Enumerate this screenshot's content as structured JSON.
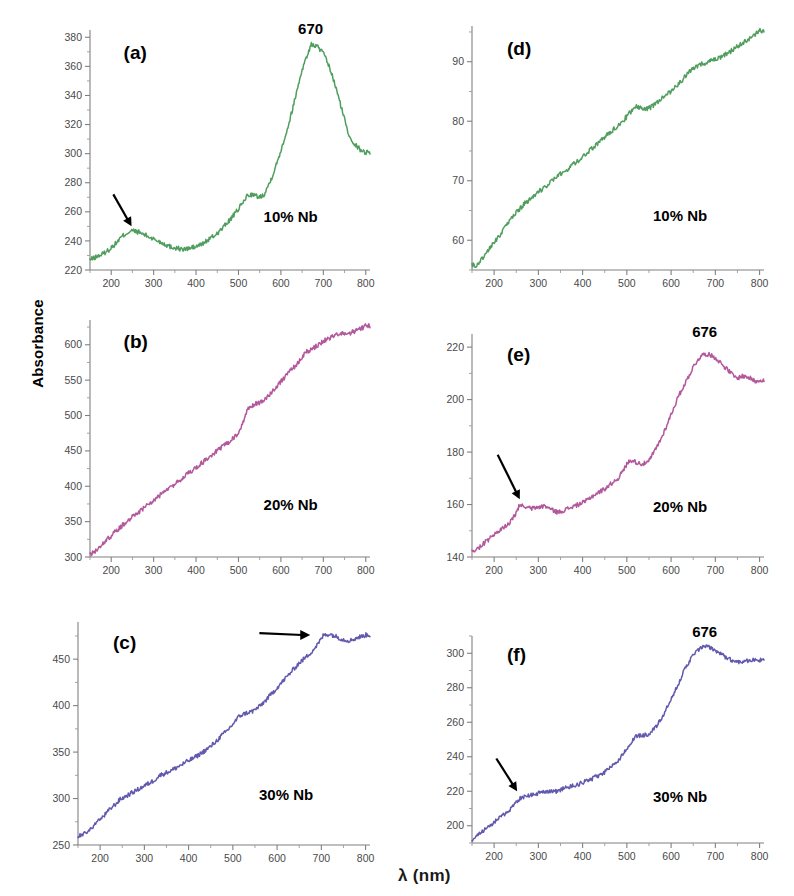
{
  "figure": {
    "y_axis_label": "Absorbance",
    "x_axis_label": "λ (nm)"
  },
  "chart_data": [
    {
      "id": "a",
      "type": "line",
      "panel_letter": "(a)",
      "series_label": "10% Nb",
      "color": "#4f9e5e",
      "title": "",
      "xlabel": "λ (nm)",
      "ylabel": "Absorbance",
      "xlim": [
        150,
        810
      ],
      "ylim": [
        220,
        385
      ],
      "xticks": [
        200,
        300,
        400,
        500,
        600,
        700,
        800
      ],
      "yticks": [
        220,
        240,
        260,
        280,
        300,
        320,
        340,
        360,
        380
      ],
      "grid": false,
      "annotations": [
        {
          "kind": "peak-label",
          "text": "670",
          "x": 670,
          "y": 381
        },
        {
          "kind": "arrow",
          "text": "",
          "from_x": 205,
          "from_y": 272,
          "to_x": 248,
          "to_y": 250
        }
      ],
      "x": [
        150,
        165,
        180,
        195,
        210,
        225,
        240,
        250,
        265,
        280,
        295,
        310,
        325,
        340,
        355,
        370,
        385,
        400,
        415,
        430,
        445,
        460,
        475,
        490,
        500,
        510,
        520,
        530,
        540,
        550,
        560,
        575,
        590,
        605,
        620,
        635,
        650,
        665,
        672,
        685,
        700,
        715,
        730,
        745,
        760,
        775,
        790,
        800
      ],
      "y": [
        227,
        229,
        231,
        234,
        238,
        243,
        246,
        247,
        246,
        244,
        242,
        240,
        238,
        236,
        235,
        234,
        235,
        236,
        238,
        241,
        244,
        248,
        253,
        258,
        262,
        266,
        271,
        272,
        271,
        270,
        272,
        281,
        293,
        307,
        322,
        340,
        358,
        370,
        375,
        374,
        369,
        359,
        345,
        329,
        313,
        306,
        302,
        301
      ]
    },
    {
      "id": "b",
      "type": "line",
      "panel_letter": "(b)",
      "series_label": "20% Nb",
      "color": "#b2589c",
      "title": "",
      "xlabel": "λ (nm)",
      "ylabel": "Absorbance",
      "xlim": [
        150,
        810
      ],
      "ylim": [
        300,
        635
      ],
      "xticks": [
        200,
        300,
        400,
        500,
        600,
        700,
        800
      ],
      "yticks": [
        300,
        350,
        400,
        450,
        500,
        550,
        600
      ],
      "grid": false,
      "annotations": [],
      "x": [
        150,
        165,
        180,
        195,
        210,
        225,
        240,
        255,
        270,
        285,
        300,
        315,
        330,
        345,
        360,
        375,
        390,
        405,
        420,
        435,
        450,
        465,
        480,
        495,
        505,
        515,
        525,
        540,
        555,
        570,
        585,
        600,
        615,
        630,
        645,
        660,
        675,
        690,
        705,
        720,
        735,
        750,
        765,
        780,
        795,
        800
      ],
      "y": [
        302,
        310,
        319,
        327,
        336,
        344,
        352,
        359,
        366,
        373,
        380,
        387,
        394,
        401,
        408,
        415,
        422,
        429,
        436,
        443,
        450,
        457,
        464,
        472,
        479,
        500,
        512,
        516,
        520,
        528,
        538,
        548,
        558,
        568,
        578,
        590,
        595,
        600,
        607,
        611,
        614,
        616,
        617,
        620,
        625,
        627
      ]
    },
    {
      "id": "c",
      "type": "line",
      "panel_letter": "(c)",
      "series_label": "30% Nb",
      "color": "#6159ad",
      "title": "",
      "xlabel": "λ (nm)",
      "ylabel": "Absorbance",
      "xlim": [
        150,
        810
      ],
      "ylim": [
        250,
        490
      ],
      "xticks": [
        200,
        300,
        400,
        500,
        600,
        700,
        800
      ],
      "yticks": [
        250,
        300,
        350,
        400,
        450
      ],
      "grid": false,
      "annotations": [
        {
          "kind": "arrow-horizontal",
          "text": "",
          "from_x": 560,
          "from_y": 478,
          "to_x": 675,
          "to_y": 476
        }
      ],
      "x": [
        150,
        165,
        180,
        195,
        210,
        225,
        235,
        245,
        260,
        275,
        290,
        305,
        320,
        335,
        345,
        360,
        375,
        390,
        405,
        420,
        435,
        450,
        465,
        475,
        485,
        500,
        515,
        530,
        545,
        560,
        575,
        590,
        605,
        620,
        635,
        650,
        665,
        680,
        695,
        705,
        720,
        735,
        750,
        765,
        780,
        795,
        800
      ],
      "y": [
        259,
        262,
        268,
        275,
        282,
        290,
        294,
        299,
        303,
        307,
        311,
        315,
        319,
        325,
        327,
        330,
        334,
        338,
        342,
        346,
        351,
        356,
        363,
        368,
        372,
        380,
        389,
        392,
        394,
        399,
        406,
        414,
        422,
        430,
        438,
        446,
        452,
        459,
        468,
        476,
        477,
        474,
        471,
        470,
        473,
        475,
        476
      ]
    },
    {
      "id": "d",
      "type": "line",
      "panel_letter": "(d)",
      "series_label": "10% Nb",
      "color": "#4f9e5e",
      "title": "",
      "xlabel": "λ (nm)",
      "ylabel": "Absorbance",
      "xlim": [
        150,
        810
      ],
      "ylim": [
        55,
        96
      ],
      "xticks": [
        200,
        300,
        400,
        500,
        600,
        700,
        800
      ],
      "yticks": [
        60,
        70,
        80,
        90
      ],
      "grid": false,
      "annotations": [],
      "x": [
        150,
        160,
        175,
        190,
        205,
        220,
        235,
        250,
        265,
        280,
        295,
        310,
        325,
        340,
        355,
        370,
        385,
        400,
        415,
        430,
        445,
        460,
        475,
        490,
        500,
        510,
        520,
        530,
        545,
        560,
        575,
        590,
        605,
        620,
        635,
        650,
        665,
        680,
        695,
        710,
        725,
        740,
        755,
        770,
        785,
        800
      ],
      "y": [
        56.0,
        55.6,
        57.2,
        58.6,
        60.1,
        61.6,
        63.2,
        64.6,
        65.9,
        66.9,
        67.8,
        68.7,
        69.6,
        70.5,
        71.4,
        72.2,
        73.1,
        74.0,
        75.0,
        76.0,
        77.0,
        78.0,
        79.0,
        80.0,
        80.8,
        81.7,
        82.5,
        82.3,
        82.0,
        82.6,
        83.6,
        84.5,
        85.4,
        86.5,
        87.8,
        88.8,
        89.5,
        89.9,
        90.2,
        90.6,
        91.3,
        92.0,
        92.8,
        93.5,
        94.2,
        95.2
      ]
    },
    {
      "id": "e",
      "type": "line",
      "panel_letter": "(e)",
      "series_label": "20% Nb",
      "color": "#b2589c",
      "title": "",
      "xlabel": "λ (nm)",
      "ylabel": "Absorbance",
      "xlim": [
        150,
        810
      ],
      "ylim": [
        140,
        225
      ],
      "xticks": [
        200,
        300,
        400,
        500,
        600,
        700,
        800
      ],
      "yticks": [
        140,
        160,
        180,
        200,
        220
      ],
      "grid": false,
      "annotations": [
        {
          "kind": "peak-label",
          "text": "676",
          "x": 676,
          "y": 223
        },
        {
          "kind": "arrow",
          "text": "",
          "from_x": 208,
          "from_y": 179,
          "to_x": 258,
          "to_y": 162
        }
      ],
      "x": [
        150,
        162,
        175,
        190,
        205,
        220,
        235,
        248,
        258,
        270,
        285,
        300,
        315,
        330,
        345,
        360,
        375,
        390,
        405,
        420,
        435,
        450,
        465,
        480,
        492,
        502,
        512,
        522,
        535,
        548,
        558,
        568,
        580,
        592,
        604,
        616,
        628,
        640,
        652,
        664,
        676,
        688,
        700,
        712,
        724,
        736,
        748,
        760,
        775,
        790,
        800
      ],
      "y": [
        142,
        143,
        145,
        147,
        149,
        151,
        153,
        156,
        160,
        159,
        158.5,
        159,
        159.5,
        158,
        157,
        158,
        159,
        160,
        161,
        163,
        164.5,
        166,
        168,
        170,
        173,
        176,
        177,
        176,
        175.5,
        176,
        179,
        182,
        186,
        191,
        196,
        201,
        205,
        209,
        213,
        216,
        217.5,
        217,
        216,
        214,
        212,
        210,
        208,
        209,
        208.5,
        207,
        207.5
      ]
    },
    {
      "id": "f",
      "type": "line",
      "panel_letter": "(f)",
      "series_label": "30% Nb",
      "color": "#6159ad",
      "title": "",
      "xlabel": "λ (nm)",
      "ylabel": "Absorbance",
      "xlim": [
        150,
        810
      ],
      "ylim": [
        190,
        310
      ],
      "xticks": [
        200,
        300,
        400,
        500,
        600,
        700,
        800
      ],
      "yticks": [
        200,
        220,
        240,
        260,
        280,
        300
      ],
      "grid": false,
      "annotations": [
        {
          "kind": "peak-label",
          "text": "676",
          "x": 676,
          "y": 308
        },
        {
          "kind": "arrow",
          "text": "",
          "from_x": 205,
          "from_y": 239,
          "to_x": 252,
          "to_y": 220
        }
      ],
      "x": [
        150,
        162,
        175,
        190,
        205,
        220,
        235,
        248,
        258,
        272,
        288,
        302,
        318,
        332,
        345,
        360,
        375,
        390,
        405,
        420,
        435,
        450,
        465,
        478,
        490,
        500,
        512,
        522,
        535,
        548,
        558,
        568,
        578,
        590,
        602,
        614,
        626,
        638,
        650,
        662,
        674,
        686,
        698,
        710,
        722,
        736,
        750,
        765,
        780,
        795,
        800
      ],
      "y": [
        192,
        194,
        197,
        200,
        203,
        206,
        209,
        213,
        216,
        217,
        218,
        219,
        219.5,
        220,
        220,
        222,
        223,
        224,
        225.5,
        227,
        229,
        231,
        234,
        237,
        241,
        245,
        249,
        252,
        252.5,
        253,
        255,
        258,
        262,
        268,
        274,
        281,
        288,
        294,
        299,
        302,
        304,
        303.5,
        302,
        300,
        298,
        296,
        295,
        295.5,
        296,
        296,
        296
      ]
    }
  ]
}
